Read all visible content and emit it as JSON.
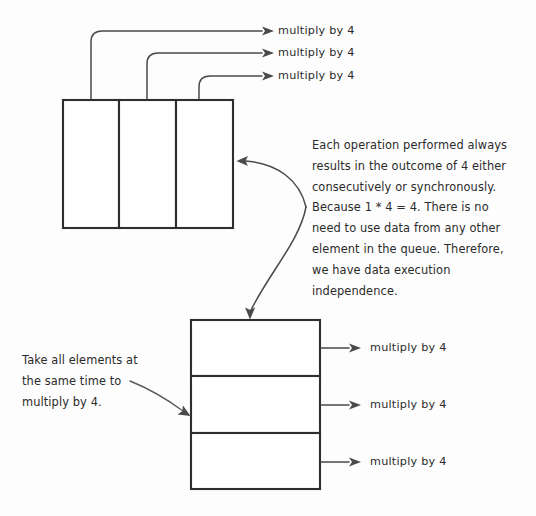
{
  "diagram": {
    "stroke_color": "#2e2e2e",
    "connector_color": "#4a4a4a",
    "background_color": "#fdfdfd",
    "text_color": "#2b2b2b"
  },
  "top_queue": {
    "name": "horizontal-queue",
    "element_count": 3,
    "elements": [
      {
        "label": ""
      },
      {
        "label": ""
      },
      {
        "label": ""
      }
    ],
    "operation_labels": [
      "multiply by 4",
      "multiply by 4",
      "multiply by 4"
    ]
  },
  "bottom_queue": {
    "name": "vertical-queue",
    "element_count": 3,
    "elements": [
      {
        "label": ""
      },
      {
        "label": ""
      },
      {
        "label": ""
      }
    ],
    "operation_labels": [
      "multiply by 4",
      "multiply by 4",
      "multiply by 4"
    ]
  },
  "notes": {
    "right_note": "Each operation performed always results in the outcome of 4 either consecutively or synchronously. Because 1 * 4 = 4.  There is no need to use data from any other element in the queue. Therefore, we have data execution independence.",
    "right_note_lines": [
      "Each operation performed always",
      "results in the outcome of 4 either",
      "consecutively or synchronously.",
      "Because 1 * 4 = 4.  There is no",
      "need to use data from any other",
      "element in the queue. Therefore,",
      "we have data execution",
      "independence."
    ],
    "left_note": "Take all elements at the same time to multiply by 4.",
    "left_note_lines": [
      "Take all elements at",
      "the same time to",
      "multiply by 4."
    ]
  }
}
